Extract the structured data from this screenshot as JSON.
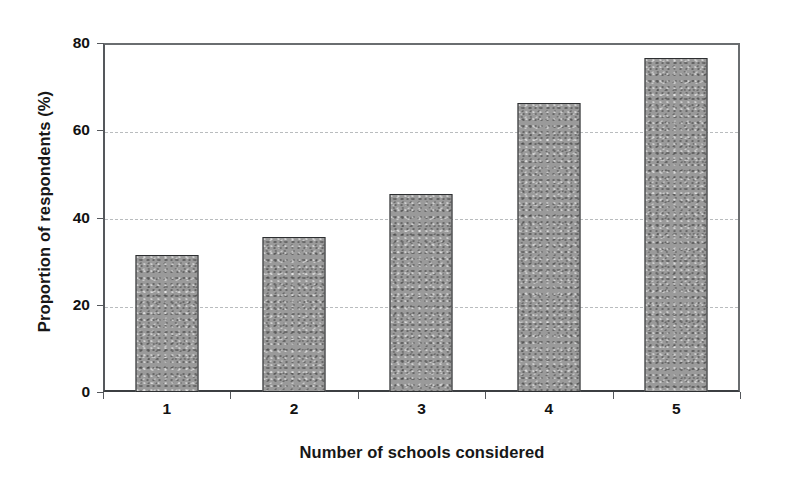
{
  "chart_data": {
    "type": "bar",
    "title": "",
    "xlabel": "Number of schools considered",
    "ylabel": "Proportion of respondents (%)",
    "categories": [
      "1",
      "2",
      "3",
      "4",
      "5"
    ],
    "values": [
      31.5,
      35.5,
      45.5,
      66.3,
      76.5
    ],
    "ylim": [
      0,
      80
    ],
    "yticks": [
      0,
      20,
      40,
      60,
      80
    ],
    "ytick_labels": [
      "0",
      "20",
      "40",
      "60",
      "80"
    ],
    "grid": "horizontal-dashed",
    "legend": "none",
    "series": [
      {
        "name": "Proportion of respondents (%)",
        "values": [
          31.5,
          35.5,
          45.5,
          66.3,
          76.5
        ]
      }
    ],
    "bar_fill_color": "#9a9a9a",
    "bar_border_color": "#2d2f31",
    "gridline_color": "#b9bcbe",
    "axis_color": "#55585c",
    "background_color": "#ffffff"
  }
}
